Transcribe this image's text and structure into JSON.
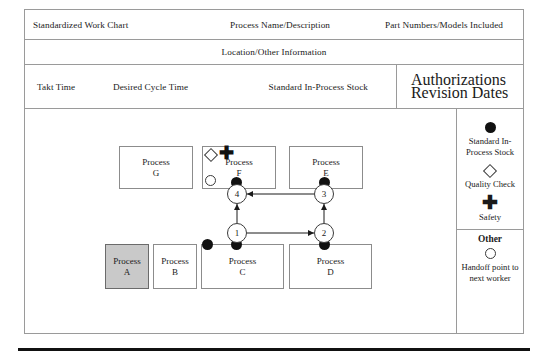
{
  "header": {
    "title": "Standardized Work Chart",
    "process_name": "Process Name/Description",
    "part_numbers": "Part Numbers/Models Included",
    "location": "Location/Other Information",
    "takt_time": "Takt Time",
    "desired_cycle_time": "Desired Cycle Time",
    "standard_in_process_stock": "Standard In-Process Stock",
    "authorizations": "Authorizations",
    "revision_dates": "Revision Dates"
  },
  "diagram": {
    "process_boxes": [
      {
        "id": "G",
        "label": "Process",
        "sub": "G"
      },
      {
        "id": "F",
        "label": "Process",
        "sub": "F"
      },
      {
        "id": "E",
        "label": "Process",
        "sub": "E"
      },
      {
        "id": "A",
        "label": "Process",
        "sub": "A"
      },
      {
        "id": "B",
        "label": "Process",
        "sub": "B"
      },
      {
        "id": "C",
        "label": "Process",
        "sub": "C"
      },
      {
        "id": "D",
        "label": "Process",
        "sub": "D"
      }
    ],
    "steps": [
      {
        "number": "1"
      },
      {
        "number": "2"
      },
      {
        "number": "3"
      },
      {
        "number": "4"
      }
    ],
    "plus_glyph": "✚"
  },
  "legend": {
    "stock_label": "Standard In-Process Stock",
    "quality_label": "Quality Check",
    "safety_label": "Safety",
    "other_title": "Other",
    "handoff_label": "Handoff point to next worker",
    "plus_glyph": "✚"
  },
  "colors": {
    "shaded_box": "#c9c9c9",
    "marker": "#111111",
    "border": "#9a9a9a"
  }
}
